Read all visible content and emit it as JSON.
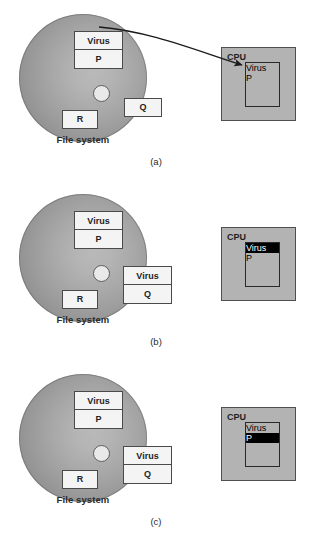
{
  "figure": {
    "panels": [
      {
        "id": "a",
        "caption": "(a)",
        "disk": {
          "label": "File system",
          "files": [
            {
              "name": "virus-p-stack",
              "rows": [
                "Virus",
                "P"
              ],
              "highlight": null
            },
            {
              "name": "file-q",
              "rows": [
                "Q"
              ],
              "highlight": null
            },
            {
              "name": "file-r",
              "rows": [
                "R"
              ],
              "highlight": null
            }
          ]
        },
        "cpu": {
          "label": "CPU",
          "rows": [
            "Virus",
            "P"
          ],
          "highlight_index": null
        },
        "arrow": {
          "visible": true,
          "from": "disk-virus-p",
          "to": "cpu-virus"
        }
      },
      {
        "id": "b",
        "caption": "(b)",
        "disk": {
          "label": "File system",
          "files": [
            {
              "name": "virus-p-stack",
              "rows": [
                "Virus",
                "P"
              ],
              "highlight": null
            },
            {
              "name": "virus-q-stack",
              "rows": [
                "Virus",
                "Q"
              ],
              "highlight": null
            },
            {
              "name": "file-r",
              "rows": [
                "R"
              ],
              "highlight": null
            }
          ]
        },
        "cpu": {
          "label": "CPU",
          "rows": [
            "Virus",
            "P"
          ],
          "highlight_index": 0
        },
        "arrow": {
          "visible": false
        }
      },
      {
        "id": "c",
        "caption": "(c)",
        "disk": {
          "label": "File system",
          "files": [
            {
              "name": "virus-p-stack",
              "rows": [
                "Virus",
                "P"
              ],
              "highlight": null
            },
            {
              "name": "virus-q-stack",
              "rows": [
                "Virus",
                "Q"
              ],
              "highlight": null
            },
            {
              "name": "file-r",
              "rows": [
                "R"
              ],
              "highlight": null
            }
          ]
        },
        "cpu": {
          "label": "CPU",
          "rows": [
            "Virus",
            "P"
          ],
          "highlight_index": 1
        },
        "arrow": {
          "visible": false
        }
      }
    ],
    "colors": {
      "disk_light": "#b9b9b9",
      "disk_dark": "#8a8a8a",
      "cpu_fill": "#b3b3b3",
      "box_fill": "#f4f4f4",
      "outline": "#4a4a4a",
      "highlight_fill": "#000000",
      "highlight_text": "#ffffff",
      "arrow": "#1a1a1a",
      "background": "#ffffff"
    }
  }
}
